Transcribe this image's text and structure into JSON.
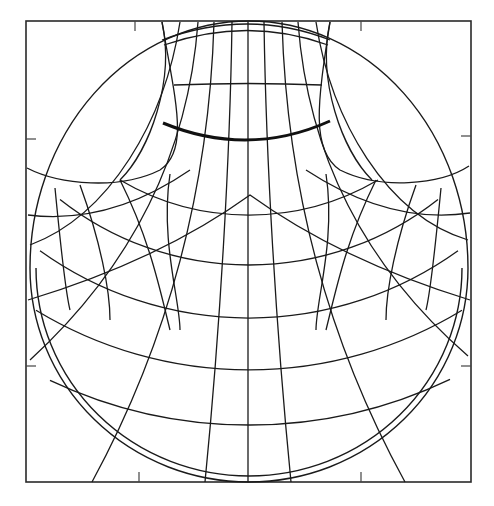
{
  "map": {
    "type": "map-projection-graticule",
    "colors": {
      "background": "#ffffff",
      "lines": "#1a1a1a",
      "frame": "#2a2a2a"
    },
    "frame": {
      "x": 26,
      "y": 21,
      "width": 445,
      "height": 461
    },
    "ticks": [
      {
        "x1": 135,
        "y1": 21,
        "x2": 135,
        "y2": 31
      },
      {
        "x1": 361,
        "y1": 21,
        "x2": 361,
        "y2": 31
      },
      {
        "x1": 139,
        "y1": 482,
        "x2": 139,
        "y2": 472
      },
      {
        "x1": 361,
        "y1": 482,
        "x2": 361,
        "y2": 472
      },
      {
        "x1": 26,
        "y1": 139,
        "x2": 36,
        "y2": 139
      },
      {
        "x1": 26,
        "y1": 366,
        "x2": 36,
        "y2": 366
      },
      {
        "x1": 471,
        "y1": 136,
        "x2": 461,
        "y2": 136
      },
      {
        "x1": 471,
        "y1": 366,
        "x2": 461,
        "y2": 366
      }
    ],
    "outline_circles": [
      "M 30 268 A 219 214 0 0 0 249 482 A 219 214 0 0 0 468 268",
      "M 36 268 A 213 208 0 0 0 249 476 A 213 208 0 0 0 462 268",
      "M 30 268 A 219 247 0 0 1 468 268"
    ],
    "cap_edges": [
      "M 27 168 C 60 185, 120 190, 160 170 C 190 150, 175 100, 162 22",
      "M 469 166 C 440 185, 380 190, 340 170 C 310 150, 318 100, 330 22"
    ],
    "parallels": [
      "M 162 40 Q 248 8 330 40",
      "M 164 45 Q 248 16 328 45",
      "M 174 85 Q 248 82 322 85",
      "M 28 215 Q 110 225 190 170 M 306 170 Q 390 225 470 213",
      "M 28 300 Q 160 260 250 195 Q 340 260 470 300"
    ],
    "bold_parallel": "M 163 123 Q 248 158 330 121",
    "concentric_parallels": [
      {
        "cx": 249,
        "cy": -40,
        "r": 255,
        "from": 120,
        "to": 378
      },
      {
        "cx": 249,
        "cy": -40,
        "r": 305,
        "from": 60,
        "to": 438
      },
      {
        "cx": 249,
        "cy": -40,
        "r": 358,
        "from": 40,
        "to": 458
      },
      {
        "cx": 249,
        "cy": -40,
        "r": 410,
        "from": 36,
        "to": 462
      },
      {
        "cx": 249,
        "cy": -40,
        "r": 465,
        "from": 50,
        "to": 450
      }
    ],
    "meridians": [
      "M 248 22 L 248 482",
      "M 232 22 C 230 160, 220 330, 205 482",
      "M 264 22 C 266 160, 276 330, 291 482",
      "M 214 22 C 210 160, 180 320, 92 482",
      "M 282 22 C 286 160, 316 320, 405 482",
      "M 198 22 C 190 130, 150 250, 30 360",
      "M 298 22 C 306 130, 346 250, 468 356",
      "M 180 22 C 165 120, 110 215, 30 245",
      "M 316 22 C 331 120, 386 215, 468 240",
      "M 162 22 C 175 80, 150 150, 120 180",
      "M 330 22 C 317 80, 342 150, 372 180",
      "M 170 174 C 160 240, 180 300, 180 330",
      "M 326 174 C 336 240, 316 300, 316 330",
      "M 120 180 C 150 240, 160 290, 170 330",
      "M 376 180 C 346 240, 336 290, 326 330",
      "M 80 185 C 100 240, 110 290, 110 320",
      "M 416 185 C 396 240, 386 290, 386 320",
      "M 55 188 C 60 240, 65 290, 70 310",
      "M 441 188 C 436 240, 431 290, 426 310"
    ]
  }
}
